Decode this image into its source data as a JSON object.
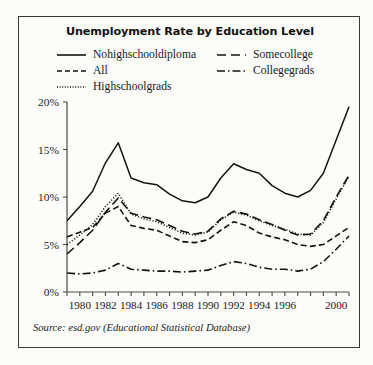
{
  "chart": {
    "title": "Unemployment Rate by Education Level",
    "source": "Source: esd.gov (Educational Statistical Database)"
  },
  "legend": {
    "items": [
      {
        "label": "Nohighschooldiploma",
        "style": "solid",
        "swatch": "legend-swatch-solid"
      },
      {
        "label": "All",
        "style": "dashed",
        "swatch": "legend-swatch-dashed"
      },
      {
        "label": "Highschoolgrads",
        "style": "dotted",
        "swatch": "legend-swatch-dotted"
      },
      {
        "label": "Somecollege",
        "style": "longdash",
        "swatch": "legend-swatch-longdash"
      },
      {
        "label": "Collegegrads",
        "style": "dashdot",
        "swatch": "legend-swatch-dashdot"
      }
    ]
  },
  "chart_data": {
    "type": "line",
    "title": "Unemployment Rate by Education Level",
    "xlabel": "",
    "ylabel": "",
    "xlim": [
      1979,
      2001
    ],
    "ylim": [
      0,
      20
    ],
    "yticks": [
      0,
      5,
      10,
      15,
      20
    ],
    "ytick_labels": [
      "0%",
      "5%",
      "10%",
      "15%",
      "20%"
    ],
    "x": [
      1979,
      1980,
      1981,
      1982,
      1983,
      1984,
      1985,
      1986,
      1987,
      1988,
      1989,
      1990,
      1991,
      1992,
      1993,
      1994,
      1995,
      1996,
      1997,
      1998,
      1999,
      2000,
      2001
    ],
    "xtick_labels": [
      "1980",
      "1982",
      "1984",
      "1986",
      "1988",
      "1990",
      "1992",
      "1994",
      "1996",
      "2000"
    ],
    "xtick_label_years": [
      1980,
      1982,
      1984,
      1986,
      1988,
      1990,
      1992,
      1994,
      1996,
      2000
    ],
    "grid": false,
    "legend_position": "top",
    "series": [
      {
        "name": "Nohighschooldiploma",
        "style": "solid",
        "values": [
          7.5,
          9.0,
          10.6,
          13.6,
          15.7,
          12.0,
          11.5,
          11.3,
          10.3,
          9.6,
          9.4,
          10.0,
          12.0,
          13.5,
          12.9,
          12.5,
          11.2,
          10.4,
          10.0,
          10.7,
          12.5,
          16.0,
          19.5
        ]
      },
      {
        "name": "All",
        "style": "dashed",
        "values": [
          5.8,
          6.3,
          6.8,
          8.3,
          9.0,
          7.0,
          6.7,
          6.5,
          5.9,
          5.3,
          5.2,
          5.5,
          6.5,
          7.4,
          7.0,
          6.2,
          5.8,
          5.5,
          5.0,
          4.8,
          5.0,
          5.9,
          6.8
        ]
      },
      {
        "name": "Highschoolgrads",
        "style": "dotted",
        "values": [
          5.0,
          6.0,
          7.1,
          9.0,
          10.4,
          8.2,
          7.7,
          7.4,
          6.8,
          6.2,
          6.0,
          6.3,
          7.6,
          8.4,
          8.1,
          7.5,
          7.0,
          6.6,
          6.1,
          6.0,
          7.3,
          9.8,
          12.2
        ]
      },
      {
        "name": "Somecollege",
        "style": "longdash",
        "values": [
          4.0,
          5.2,
          6.5,
          8.4,
          9.9,
          8.3,
          7.9,
          7.6,
          7.0,
          6.4,
          6.1,
          6.4,
          7.7,
          8.5,
          8.2,
          7.6,
          7.1,
          6.5,
          6.0,
          6.1,
          7.5,
          10.0,
          12.3
        ]
      },
      {
        "name": "Collegegrads",
        "style": "dashdot",
        "values": [
          2.0,
          1.9,
          2.0,
          2.3,
          3.0,
          2.4,
          2.3,
          2.2,
          2.2,
          2.1,
          2.2,
          2.3,
          2.8,
          3.2,
          3.0,
          2.6,
          2.4,
          2.4,
          2.2,
          2.4,
          3.2,
          4.5,
          5.9
        ]
      }
    ]
  }
}
